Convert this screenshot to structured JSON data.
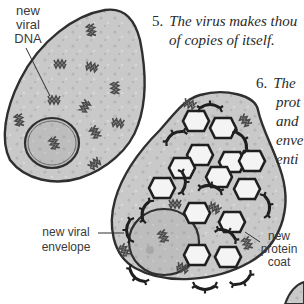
{
  "figure": {
    "type": "textbook-illustration"
  },
  "steps": [
    {
      "number": "5.",
      "lines": [
        "The virus makes thou",
        "of copies of itself."
      ]
    },
    {
      "number": "6.",
      "lines": [
        "The",
        "prot",
        "and",
        "enve",
        "enti"
      ]
    }
  ],
  "labels": {
    "dna": [
      "new",
      "viral",
      "DNA"
    ],
    "envelope": [
      "new viral",
      "envelope"
    ],
    "protein_coat": [
      "new",
      "protein",
      "coat"
    ]
  },
  "colors": {
    "cytoplasm": "#c9c9c9",
    "nucleus": "#bdbdbd",
    "outline": "#2f2f2f",
    "capsid_fill": "#f4f4f4",
    "text": "#2a2a2a"
  }
}
